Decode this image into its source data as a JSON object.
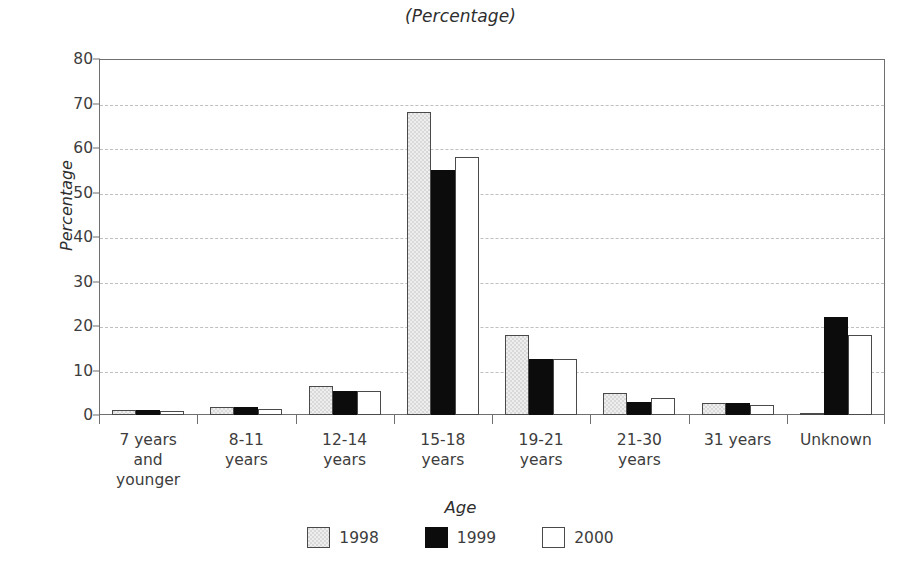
{
  "chart_data": {
    "type": "bar",
    "title": "(Percentage)",
    "xlabel": "Age",
    "ylabel": "Percentage",
    "ylim": [
      0,
      80
    ],
    "ytick_step": 10,
    "yticks": [
      0,
      10,
      20,
      30,
      40,
      50,
      60,
      70,
      80
    ],
    "grid": true,
    "grid_style": "dashed-horizontal",
    "legend_position": "bottom-center",
    "categories": [
      "7 years\nand\nyounger",
      "8-11\nyears",
      "12-14\nyears",
      "15-18\nyears",
      "19-21\nyears",
      "21-30\nyears",
      "31 years",
      "Unknown"
    ],
    "category_labels": [
      [
        "7 years",
        "and",
        "younger"
      ],
      [
        "8-11",
        "years"
      ],
      [
        "12-14",
        "years"
      ],
      [
        "15-18",
        "years"
      ],
      [
        "19-21",
        "years"
      ],
      [
        "21-30",
        "years"
      ],
      [
        "31 years"
      ],
      [
        "Unknown"
      ]
    ],
    "series": [
      {
        "name": "1998",
        "color": "#d9d9d9",
        "values": [
          1.2,
          1.8,
          6.5,
          68,
          18,
          5.0,
          2.8,
          0.5
        ]
      },
      {
        "name": "1999",
        "color": "#0c0c0c",
        "values": [
          1.2,
          1.8,
          5.5,
          55,
          12.5,
          3.0,
          2.8,
          22
        ]
      },
      {
        "name": "2000",
        "color": "#ffffff",
        "values": [
          1.0,
          1.4,
          5.5,
          58,
          12.5,
          3.8,
          2.3,
          18
        ]
      }
    ]
  },
  "legend": {
    "entries": [
      {
        "label": "1998",
        "key": "y1998"
      },
      {
        "label": "1999",
        "key": "y1999"
      },
      {
        "label": "2000",
        "key": "y2000"
      }
    ]
  }
}
